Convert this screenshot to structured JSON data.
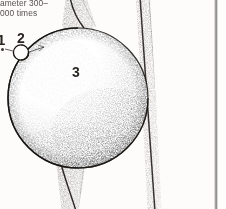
{
  "figure": {
    "kind": "engraved-stipple-illustration",
    "background_color": "#fdfcfa",
    "ink_color": "#241f1b"
  },
  "caption": {
    "lines": [
      "ameter 300–",
      "000 times"
    ],
    "line_1": "ameter 300–",
    "line_2": "000 times",
    "cropped": "true"
  },
  "callouts": [
    {
      "id": "1",
      "label": "1"
    },
    {
      "id": "2",
      "label": "2"
    },
    {
      "id": "3",
      "label": "3"
    }
  ],
  "callout_1": {
    "label": "1"
  },
  "callout_2": {
    "label": "2"
  },
  "callout_3": {
    "label": "3"
  },
  "shapes": {
    "large_sphere": {
      "cx": 78,
      "cy": 98,
      "r": 70
    },
    "small_sphere": {
      "cx": 21,
      "cy": 52,
      "r": 7.5
    },
    "vertical_band": {
      "top_x": 141,
      "bottom_x": 156
    },
    "upper_stem": {
      "x": 72,
      "y": 0
    },
    "lower_stem": {
      "x": 62,
      "y": 168
    }
  }
}
